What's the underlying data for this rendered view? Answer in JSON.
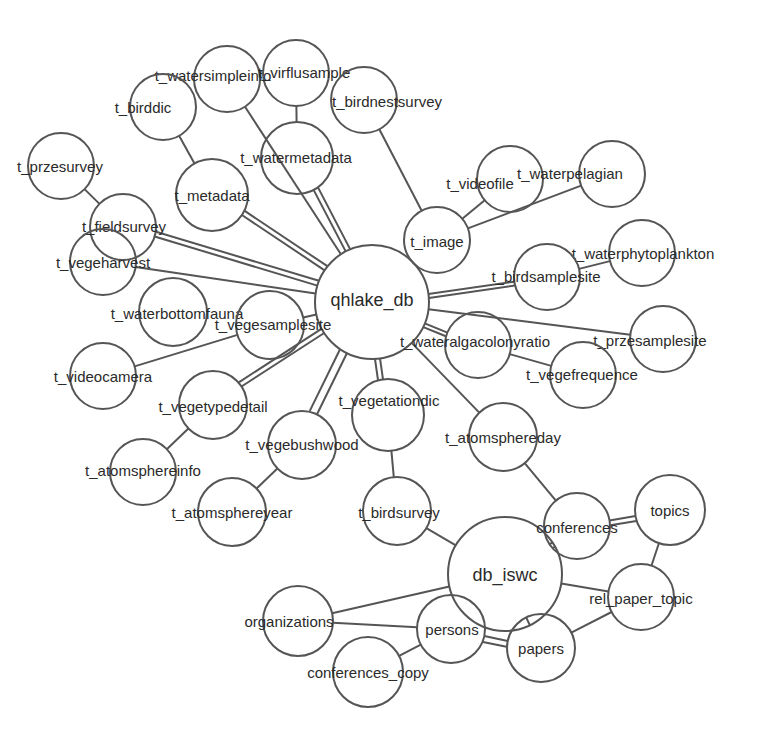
{
  "diagram": {
    "title": "",
    "type": "database-graph",
    "colors": {
      "stroke": "#555555",
      "text": "#2a2a2a",
      "background": "#ffffff"
    },
    "nodes": [
      {
        "id": "qhlake_db",
        "label": "qhlake_db",
        "cx": 372,
        "cy": 302,
        "r": 57,
        "lx": 372,
        "ly": 300,
        "big": true
      },
      {
        "id": "t_watersimpleinfo",
        "label": "t_watersimpleinfo",
        "cx": 227,
        "cy": 79,
        "r": 33,
        "lx": 213,
        "ly": 75
      },
      {
        "id": "t_virflusample",
        "label": "t_virflusample",
        "cx": 296,
        "cy": 73,
        "r": 33,
        "lx": 304,
        "ly": 72
      },
      {
        "id": "t_birddic",
        "label": "t_birddic",
        "cx": 163,
        "cy": 107,
        "r": 33,
        "lx": 143,
        "ly": 107
      },
      {
        "id": "t_birdnestsurvey",
        "label": "t_birdnestsurvey",
        "cx": 364,
        "cy": 100,
        "r": 33,
        "lx": 387,
        "ly": 101
      },
      {
        "id": "t_przesurvey",
        "label": "t_przesurvey",
        "cx": 61,
        "cy": 166,
        "r": 33,
        "lx": 60,
        "ly": 166
      },
      {
        "id": "t_metadata",
        "label": "t_metadata",
        "cx": 212,
        "cy": 195,
        "r": 36,
        "lx": 212,
        "ly": 195
      },
      {
        "id": "t_watermetadata",
        "label": "t_watermetadata",
        "cx": 297,
        "cy": 158,
        "r": 36,
        "lx": 296,
        "ly": 157
      },
      {
        "id": "t_fieldsurvey",
        "label": "t_fieldsurvey",
        "cx": 123,
        "cy": 227,
        "r": 33,
        "lx": 124,
        "ly": 226
      },
      {
        "id": "t_videofile",
        "label": "t_videofile",
        "cx": 510,
        "cy": 179,
        "r": 33,
        "lx": 480,
        "ly": 183
      },
      {
        "id": "t_waterpelagian",
        "label": "t_waterpelagian",
        "cx": 612,
        "cy": 174,
        "r": 33,
        "lx": 570,
        "ly": 173
      },
      {
        "id": "t_image",
        "label": "t_image",
        "cx": 437,
        "cy": 240,
        "r": 33,
        "lx": 437,
        "ly": 241
      },
      {
        "id": "t_vegeharvest",
        "label": "t_vegeharvest",
        "cx": 103,
        "cy": 262,
        "r": 33,
        "lx": 103,
        "ly": 262
      },
      {
        "id": "t_waterphytoplankton",
        "label": "t_waterphytoplankton",
        "cx": 642,
        "cy": 253,
        "r": 33,
        "lx": 643,
        "ly": 253
      },
      {
        "id": "t_birdsamplesite",
        "label": "t_birdsamplesite",
        "cx": 547,
        "cy": 277,
        "r": 33,
        "lx": 546,
        "ly": 276
      },
      {
        "id": "t_waterbottomfauna",
        "label": "t_waterbottomfauna",
        "cx": 173,
        "cy": 312,
        "r": 34,
        "lx": 177,
        "ly": 313
      },
      {
        "id": "t_vegesamplesite",
        "label": "t_vegesamplesite",
        "cx": 270,
        "cy": 325,
        "r": 34,
        "lx": 273,
        "ly": 324
      },
      {
        "id": "t_przesamplesite",
        "label": "t_przesamplesite",
        "cx": 663,
        "cy": 339,
        "r": 33,
        "lx": 650,
        "ly": 340
      },
      {
        "id": "t_wateralgacolonyratio",
        "label": "t_wateralgacolonyratio",
        "cx": 478,
        "cy": 345,
        "r": 33,
        "lx": 475,
        "ly": 341
      },
      {
        "id": "t_videocamera",
        "label": "t_videocamera",
        "cx": 103,
        "cy": 376,
        "r": 33,
        "lx": 103,
        "ly": 376
      },
      {
        "id": "t_vegefrequence",
        "label": "t_vegefrequence",
        "cx": 583,
        "cy": 375,
        "r": 33,
        "lx": 582,
        "ly": 374
      },
      {
        "id": "t_vegetypedetail",
        "label": "t_vegetypedetail",
        "cx": 213,
        "cy": 405,
        "r": 34,
        "lx": 213,
        "ly": 406
      },
      {
        "id": "t_vegetationdic",
        "label": "t_vegetationdic",
        "cx": 388,
        "cy": 415,
        "r": 36,
        "lx": 389,
        "ly": 400
      },
      {
        "id": "t_atomsphereday",
        "label": "t_atomsphereday",
        "cx": 503,
        "cy": 437,
        "r": 34,
        "lx": 503,
        "ly": 437
      },
      {
        "id": "t_atomsphereinfo",
        "label": "t_atomsphereinfo",
        "cx": 143,
        "cy": 472,
        "r": 33,
        "lx": 143,
        "ly": 470
      },
      {
        "id": "t_vegebushwood",
        "label": "t_vegebushwood",
        "cx": 302,
        "cy": 445,
        "r": 34,
        "lx": 302,
        "ly": 444
      },
      {
        "id": "t_atomsphereyear",
        "label": "t_atomsphereyear",
        "cx": 232,
        "cy": 512,
        "r": 34,
        "lx": 232,
        "ly": 512
      },
      {
        "id": "t_birdsurvey",
        "label": "t_birdsurvey",
        "cx": 397,
        "cy": 511,
        "r": 34,
        "lx": 399,
        "ly": 512
      },
      {
        "id": "db_iswc",
        "label": "db_iswc",
        "cx": 505,
        "cy": 574,
        "r": 57,
        "lx": 505,
        "ly": 575,
        "big": true
      },
      {
        "id": "conferences",
        "label": "conferences",
        "cx": 577,
        "cy": 526,
        "r": 33,
        "lx": 577,
        "ly": 527
      },
      {
        "id": "topics",
        "label": "topics",
        "cx": 670,
        "cy": 510,
        "r": 35,
        "lx": 670,
        "ly": 510
      },
      {
        "id": "rel_paper_topic",
        "label": "rel_paper_topic",
        "cx": 641,
        "cy": 597,
        "r": 33,
        "lx": 641,
        "ly": 598
      },
      {
        "id": "organizations",
        "label": "organizations",
        "cx": 298,
        "cy": 621,
        "r": 35,
        "lx": 289,
        "ly": 621
      },
      {
        "id": "persons",
        "label": "persons",
        "cx": 451,
        "cy": 629,
        "r": 34,
        "lx": 452,
        "ly": 629
      },
      {
        "id": "papers",
        "label": "papers",
        "cx": 541,
        "cy": 648,
        "r": 34,
        "lx": 541,
        "ly": 648
      },
      {
        "id": "conferences_copy",
        "label": "conferences_copy",
        "cx": 368,
        "cy": 672,
        "r": 35,
        "lx": 368,
        "ly": 672
      }
    ],
    "edges": [
      {
        "from": "qhlake_db",
        "to": "t_watersimpleinfo"
      },
      {
        "from": "qhlake_db",
        "to": "t_metadata"
      },
      {
        "from": "qhlake_db",
        "to": "t_metadata",
        "offset": 5
      },
      {
        "from": "t_metadata",
        "to": "t_birddic"
      },
      {
        "from": "qhlake_db",
        "to": "t_watermetadata"
      },
      {
        "from": "qhlake_db",
        "to": "t_watermetadata",
        "offset": 5
      },
      {
        "from": "t_watermetadata",
        "to": "t_virflusample"
      },
      {
        "from": "qhlake_db",
        "to": "t_image"
      },
      {
        "from": "t_image",
        "to": "t_birdnestsurvey"
      },
      {
        "from": "t_image",
        "to": "t_videofile"
      },
      {
        "from": "t_image",
        "to": "t_waterpelagian"
      },
      {
        "from": "qhlake_db",
        "to": "t_fieldsurvey"
      },
      {
        "from": "qhlake_db",
        "to": "t_fieldsurvey",
        "offset": 5
      },
      {
        "from": "t_fieldsurvey",
        "to": "t_przesurvey"
      },
      {
        "from": "qhlake_db",
        "to": "t_vegeharvest"
      },
      {
        "from": "qhlake_db",
        "to": "t_birdsamplesite"
      },
      {
        "from": "qhlake_db",
        "to": "t_birdsamplesite",
        "offset": 4
      },
      {
        "from": "t_birdsamplesite",
        "to": "t_waterphytoplankton"
      },
      {
        "from": "qhlake_db",
        "to": "t_vegesamplesite"
      },
      {
        "from": "t_vegesamplesite",
        "to": "t_videocamera"
      },
      {
        "from": "qhlake_db",
        "to": "t_przesamplesite"
      },
      {
        "from": "qhlake_db",
        "to": "t_wateralgacolonyratio"
      },
      {
        "from": "qhlake_db",
        "to": "t_wateralgacolonyratio",
        "offset": 4
      },
      {
        "from": "t_wateralgacolonyratio",
        "to": "t_vegefrequence"
      },
      {
        "from": "qhlake_db",
        "to": "t_vegetypedetail"
      },
      {
        "from": "qhlake_db",
        "to": "t_vegetypedetail",
        "offset": 5
      },
      {
        "from": "t_vegetypedetail",
        "to": "t_atomsphereinfo"
      },
      {
        "from": "qhlake_db",
        "to": "t_vegebushwood"
      },
      {
        "from": "qhlake_db",
        "to": "t_vegebushwood",
        "offset": 8
      },
      {
        "from": "t_vegebushwood",
        "to": "t_atomsphereyear"
      },
      {
        "from": "qhlake_db",
        "to": "t_vegetationdic"
      },
      {
        "from": "qhlake_db",
        "to": "t_vegetationdic",
        "offset": 5
      },
      {
        "from": "t_vegetationdic",
        "to": "t_birdsurvey"
      },
      {
        "from": "qhlake_db",
        "to": "t_atomsphereday"
      },
      {
        "from": "t_atomsphereday",
        "to": "conferences"
      },
      {
        "from": "t_birdsurvey",
        "to": "db_iswc"
      },
      {
        "from": "db_iswc",
        "to": "conferences"
      },
      {
        "from": "db_iswc",
        "to": "conferences",
        "offset": 5
      },
      {
        "from": "conferences",
        "to": "topics"
      },
      {
        "from": "conferences",
        "to": "topics",
        "offset": 5
      },
      {
        "from": "topics",
        "to": "rel_paper_topic"
      },
      {
        "from": "db_iswc",
        "to": "rel_paper_topic"
      },
      {
        "from": "rel_paper_topic",
        "to": "papers"
      },
      {
        "from": "db_iswc",
        "to": "papers"
      },
      {
        "from": "db_iswc",
        "to": "organizations"
      },
      {
        "from": "organizations",
        "to": "persons"
      },
      {
        "from": "persons",
        "to": "papers"
      },
      {
        "from": "persons",
        "to": "papers",
        "offset": 6
      },
      {
        "from": "persons",
        "to": "conferences_copy"
      }
    ]
  }
}
